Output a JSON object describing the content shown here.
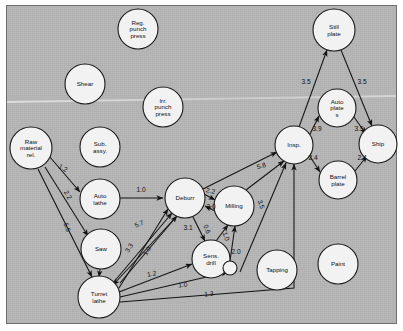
{
  "figure": {
    "type": "network-diagram",
    "background_color": "#b5b5b5",
    "node_fill": "#f2f2f2",
    "ink_color": "#141414"
  },
  "nodes": [
    {
      "id": "reg_punch",
      "label": [
        "Reg.",
        "punch",
        "press"
      ],
      "cx": 138,
      "cy": 29,
      "r": 20
    },
    {
      "id": "shear",
      "label": [
        "Shear"
      ],
      "cx": 85,
      "cy": 84,
      "r": 20
    },
    {
      "id": "irr_punch",
      "label": [
        "Irr.",
        "punch",
        "press"
      ],
      "cx": 163,
      "cy": 107,
      "r": 20
    },
    {
      "id": "raw_material",
      "label": [
        "Raw",
        "material",
        "rel."
      ],
      "cx": 31,
      "cy": 148,
      "r": 21
    },
    {
      "id": "sub_assy",
      "label": [
        "Sub.",
        "assy."
      ],
      "cx": 100,
      "cy": 147,
      "r": 20
    },
    {
      "id": "still_plate",
      "label": [
        "Still",
        "plate"
      ],
      "cx": 334,
      "cy": 30,
      "r": 21
    },
    {
      "id": "auto_plate",
      "label": [
        "Auto",
        "plate",
        "s"
      ],
      "cx": 337,
      "cy": 108,
      "r": 19
    },
    {
      "id": "insp",
      "label": [
        "Insp."
      ],
      "cx": 294,
      "cy": 145,
      "r": 19
    },
    {
      "id": "ship",
      "label": [
        "Ship"
      ],
      "cx": 378,
      "cy": 144,
      "r": 19
    },
    {
      "id": "barrel_plate",
      "label": [
        "Barrel",
        "plate"
      ],
      "cx": 338,
      "cy": 180,
      "r": 19
    },
    {
      "id": "auto_lathe",
      "label": [
        "Auto",
        "lathe"
      ],
      "cx": 100,
      "cy": 199,
      "r": 20
    },
    {
      "id": "deburr",
      "label": [
        "Deburr"
      ],
      "cx": 185,
      "cy": 198,
      "r": 20
    },
    {
      "id": "milling",
      "label": [
        "Milling"
      ],
      "cx": 234,
      "cy": 206,
      "r": 20
    },
    {
      "id": "saw",
      "label": [
        "Saw"
      ],
      "cx": 101,
      "cy": 249,
      "r": 20
    },
    {
      "id": "sens_drill",
      "label": [
        "Sens.",
        "drill"
      ],
      "cx": 211,
      "cy": 259,
      "r": 19
    },
    {
      "id": "tapping",
      "label": [
        "Tapping"
      ],
      "cx": 277,
      "cy": 270,
      "r": 20
    },
    {
      "id": "paint",
      "label": [
        "Paint"
      ],
      "cx": 338,
      "cy": 264,
      "r": 20
    },
    {
      "id": "turret_lathe",
      "label": [
        "Turret",
        "lathe"
      ],
      "cx": 99,
      "cy": 297,
      "r": 21
    }
  ],
  "unlabeled_dot": {
    "id": "small-node",
    "cx": 230,
    "cy": 268,
    "r": 7
  },
  "edges": [
    {
      "from": "raw_material",
      "to": "auto_lathe",
      "weight": "1.2",
      "lx": 62,
      "ly": 170,
      "rot": 28
    },
    {
      "from": "raw_material",
      "to": "saw",
      "weight": "2.2",
      "lx": 66,
      "ly": 196,
      "rot": 62
    },
    {
      "from": "raw_material",
      "to": "turret_lathe",
      "weight": "5.5",
      "lx": 65,
      "ly": 228,
      "rot": 70
    },
    {
      "from": "auto_lathe",
      "to": "deburr",
      "weight": "1.0",
      "lx": 141,
      "ly": 192,
      "rot": 0
    },
    {
      "from": "saw",
      "to": "turret_lathe",
      "weight": "",
      "lx": 0,
      "ly": 0,
      "rot": 0
    },
    {
      "from": "turret_lathe",
      "to": "deburr",
      "weight": "5.7",
      "lx": 140,
      "ly": 226,
      "rot": -22
    },
    {
      "from": "turret_lathe",
      "to": "deburr",
      "weight": "3.3",
      "lx": 131,
      "ly": 249,
      "rot": -58
    },
    {
      "from": "turret_lathe",
      "to": "deburr",
      "weight": "1.0",
      "lx": 149,
      "ly": 252,
      "rot": -62
    },
    {
      "from": "deburr",
      "to": "turret_lathe",
      "weight": "3.1",
      "lx": 188,
      "ly": 230,
      "rot": 0
    },
    {
      "from": "deburr",
      "to": "milling",
      "weight": "2.2",
      "lx": 210,
      "ly": 193,
      "rot": 14
    },
    {
      "from": "milling",
      "to": "deburr",
      "weight": "3.0",
      "lx": 211,
      "ly": 209,
      "rot": 0
    },
    {
      "from": "deburr",
      "to": "sens_drill",
      "weight": "0.6",
      "lx": 205,
      "ly": 230,
      "rot": 68
    },
    {
      "from": "sens_drill",
      "to": "milling",
      "weight": "1.0",
      "lx": 224,
      "ly": 237,
      "rot": 72
    },
    {
      "from": "deburr",
      "to": "insp",
      "weight": "5.8",
      "lx": 262,
      "ly": 168,
      "rot": -16
    },
    {
      "from": "milling",
      "to": "insp",
      "weight": "3.5",
      "lx": 259,
      "ly": 205,
      "rot": 72
    },
    {
      "from": "turret_lathe",
      "to": "sens_drill",
      "weight": "1.2",
      "lx": 152,
      "ly": 276,
      "rot": -10
    },
    {
      "from": "turret_lathe",
      "to": "sens_drill",
      "weight": "1.0",
      "lx": 183,
      "ly": 287,
      "rot": -7
    },
    {
      "from": "turret_lathe",
      "to": "insp",
      "weight": "1.3",
      "lx": 209,
      "ly": 296,
      "rot": -5
    },
    {
      "from": "sens_drill",
      "to": "small_node",
      "weight": "2.0",
      "lx": 236,
      "ly": 254,
      "rot": 0
    },
    {
      "from": "insp",
      "to": "still_plate",
      "weight": "3.5",
      "lx": 306,
      "ly": 84,
      "rot": 0
    },
    {
      "from": "still_plate",
      "to": "ship",
      "weight": "3.5",
      "lx": 362,
      "ly": 84,
      "rot": 0
    },
    {
      "from": "insp",
      "to": "auto_plate",
      "weight": "3.9",
      "lx": 317,
      "ly": 131,
      "rot": 0
    },
    {
      "from": "auto_plate",
      "to": "ship",
      "weight": "3.9",
      "lx": 359,
      "ly": 131,
      "rot": 0
    },
    {
      "from": "insp",
      "to": "barrel_plate",
      "weight": "2.4",
      "lx": 313,
      "ly": 160,
      "rot": 0
    },
    {
      "from": "barrel_plate",
      "to": "ship",
      "weight": "2.4",
      "lx": 362,
      "ly": 160,
      "rot": 0
    }
  ]
}
